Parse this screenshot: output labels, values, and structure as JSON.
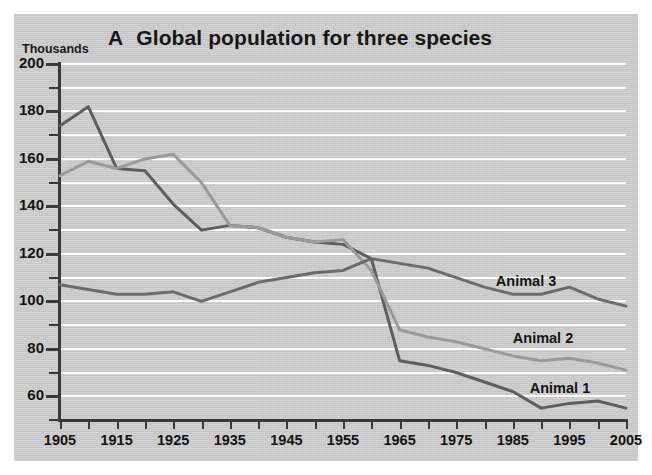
{
  "figure": {
    "panel_letter": "A",
    "title": "Global population for three species",
    "unit_label": "Thousands"
  },
  "chart_data": {
    "type": "line",
    "subtitle": "",
    "xlabel": "",
    "ylabel": "Thousands",
    "xlim": [
      1905,
      2005
    ],
    "ylim": [
      50,
      200
    ],
    "yticks": [
      60,
      80,
      100,
      120,
      140,
      160,
      180,
      200
    ],
    "yticks_minor": [
      50,
      70,
      90,
      110,
      130,
      150,
      170,
      190
    ],
    "xticks": [
      1905,
      1910,
      1915,
      1920,
      1925,
      1930,
      1935,
      1940,
      1945,
      1950,
      1955,
      1960,
      1965,
      1970,
      1975,
      1980,
      1985,
      1990,
      1995,
      2000,
      2005
    ],
    "xticklabels": [
      "1905",
      "1915",
      "1925",
      "1935",
      "1945",
      "1955",
      "1965",
      "1975",
      "1985",
      "1995",
      "2005"
    ],
    "xticklabel_values": [
      1905,
      1915,
      1925,
      1935,
      1945,
      1955,
      1965,
      1975,
      1985,
      1995,
      2005
    ],
    "grid": true,
    "grid_color": "#fdfdfd",
    "grid_axis": "y",
    "background_color": "#cfcfcf",
    "legend": "inline-labels",
    "legend_position": "inline right",
    "x": [
      1905,
      1910,
      1915,
      1920,
      1925,
      1930,
      1935,
      1940,
      1945,
      1950,
      1955,
      1960,
      1965,
      1970,
      1975,
      1980,
      1985,
      1990,
      1995,
      2000,
      2005
    ],
    "series": [
      {
        "name": "Animal 1",
        "color": "#5e5e5e",
        "label_x": 1988,
        "label_y": 63,
        "values": [
          174,
          182,
          156,
          155,
          141,
          130,
          132,
          131,
          127,
          125,
          124,
          118,
          75,
          73,
          70,
          66,
          62,
          55,
          57,
          58,
          55
        ]
      },
      {
        "name": "Animal 2",
        "color": "#9a9a9a",
        "label_x": 1985,
        "label_y": 84,
        "values": [
          153,
          159,
          156,
          160,
          162,
          150,
          132,
          131,
          127,
          125,
          126,
          113,
          88,
          85,
          83,
          80,
          77,
          75,
          76,
          74,
          71
        ]
      },
      {
        "name": "Animal 3",
        "color": "#6b6b6b",
        "label_x": 1982,
        "label_y": 108,
        "values": [
          107,
          105,
          103,
          103,
          104,
          100,
          104,
          108,
          110,
          112,
          113,
          118,
          116,
          114,
          110,
          106,
          103,
          103,
          106,
          101,
          98
        ]
      }
    ]
  }
}
